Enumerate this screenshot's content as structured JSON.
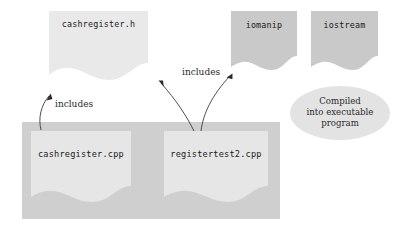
{
  "diagram": {
    "background_color": "#ffffff",
    "colors": {
      "header_light": "#e8e8e8",
      "header_dark": "#c9c9c9",
      "container_gray": "#cfcfcf",
      "inner_doc": "#e6e6e6",
      "callout_fill": "#e3e3e3",
      "text": "#1a1a1a",
      "arrow": "#3a3a3a"
    },
    "nodes": {
      "header_file": {
        "label": "cashregister.h",
        "kind": "document",
        "shade": "light"
      },
      "iomanip": {
        "label": "iomanip",
        "kind": "document",
        "shade": "dark"
      },
      "iostream": {
        "label": "iostream",
        "kind": "document",
        "shade": "dark"
      },
      "source_impl": {
        "label": "cashregister.cpp",
        "kind": "document",
        "shade": "light"
      },
      "source_test": {
        "label": "registertest2.cpp",
        "kind": "document",
        "shade": "light"
      }
    },
    "edges": {
      "includes_left": {
        "label": "includes",
        "from": "cashregister.cpp",
        "to": "cashregister.h"
      },
      "includes_right": {
        "label": "includes",
        "from": "registertest2.cpp",
        "to": "cashregister.h and iomanip"
      }
    },
    "callout": {
      "line1": "Compiled",
      "line2": "into executable",
      "line3": "program"
    }
  }
}
